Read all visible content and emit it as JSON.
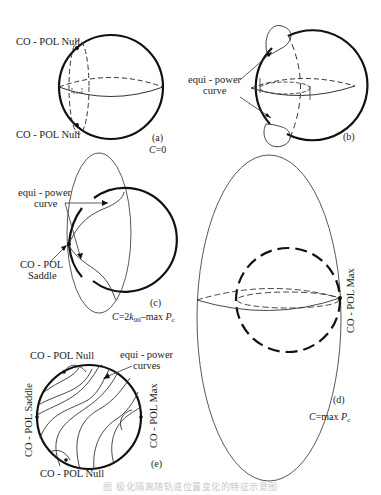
{
  "figure": {
    "panels": {
      "a": {
        "label": "(a)",
        "condition": "C=0",
        "annotations": {
          "top": "CO - POL Null",
          "bottom": "CO - POL Null"
        }
      },
      "b": {
        "label": "(b)",
        "annotations": {
          "curve_line1": "equi - power",
          "curve_line2": "curve"
        }
      },
      "c": {
        "label": "(c)",
        "condition": "C=2k₀₀–max Pᴄ",
        "condition_parts": {
          "c": "C",
          "eq": "=2",
          "k": "k",
          "sub": "00",
          "rest": "–max ",
          "p": "P",
          "psub": "c"
        },
        "annotations": {
          "curve_line1": "equi - power",
          "curve_line2": "curve",
          "saddle_line1": "CO - POL",
          "saddle_line2": "Saddle"
        }
      },
      "d": {
        "label": "(d)",
        "condition_parts": {
          "c": "C",
          "rest": "=max ",
          "p": "P",
          "psub": "c"
        },
        "annotations": {
          "max": "CO - POL Max"
        }
      },
      "e": {
        "label": "(e)",
        "annotations": {
          "top": "CO - POL Null",
          "bottom": "CO - POL Null",
          "left": "CO - POL Saddle",
          "right": "CO - POL Max",
          "curves_line1": "equi - power",
          "curves_line2": "curves"
        }
      }
    },
    "caption": "图  极化隔离随轨道位置变化的特征示意图"
  },
  "colors": {
    "stroke": "#111111",
    "thin": "#333333",
    "caption": "#c8c8c8"
  }
}
